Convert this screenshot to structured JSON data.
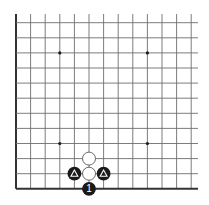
{
  "board": {
    "description": "Go board corner diagram (lower-left region), board continues to top and right",
    "origin_x": 16,
    "origin_y": 22.7,
    "spacing_x": 14.6,
    "spacing_y": 15.1,
    "cols": 13,
    "rows": 12,
    "line_top": 14,
    "line_right": 198,
    "edges": [
      "left",
      "bottom"
    ],
    "colors": {
      "background": "#ffffff",
      "grid": "#6e6e6e",
      "edge": "#333333",
      "star": "#1a1a1a",
      "black_stone": "#1a1a1a",
      "white_stone": "#ffffff",
      "white_stone_border": "#444444",
      "mark_on_black": "#ffffff"
    }
  },
  "star_points": [
    {
      "col": 3,
      "row": 2
    },
    {
      "col": 9,
      "row": 2
    },
    {
      "col": 3,
      "row": 8
    },
    {
      "col": 9,
      "row": 8
    }
  ],
  "stones": [
    {
      "color": "white",
      "col": 5,
      "row": 9,
      "mark": ""
    },
    {
      "color": "white",
      "col": 5,
      "row": 10,
      "mark": ""
    },
    {
      "color": "black",
      "col": 4,
      "row": 10,
      "mark": "triangle"
    },
    {
      "color": "black",
      "col": 6,
      "row": 10,
      "mark": "triangle"
    },
    {
      "color": "black",
      "col": 5,
      "row": 11,
      "mark": "1"
    }
  ]
}
